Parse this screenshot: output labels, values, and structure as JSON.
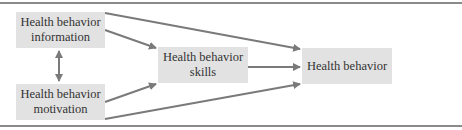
{
  "diagram": {
    "nodes": {
      "information": {
        "line1": "Health behavior",
        "line2": "information"
      },
      "motivation": {
        "line1": "Health behavior",
        "line2": "motivation"
      },
      "skills": {
        "line1": "Health behavior",
        "line2": "skills"
      },
      "behavior": {
        "line1": "Health behavior"
      }
    },
    "edges": [
      {
        "from": "information",
        "to": "motivation",
        "type": "bidirectional"
      },
      {
        "from": "information",
        "to": "skills"
      },
      {
        "from": "motivation",
        "to": "skills"
      },
      {
        "from": "information",
        "to": "behavior"
      },
      {
        "from": "motivation",
        "to": "behavior"
      },
      {
        "from": "skills",
        "to": "behavior"
      }
    ],
    "colors": {
      "box": "#e2e2e2",
      "arrow": "#7a7a7a",
      "frame": "#8a8a8a"
    }
  }
}
